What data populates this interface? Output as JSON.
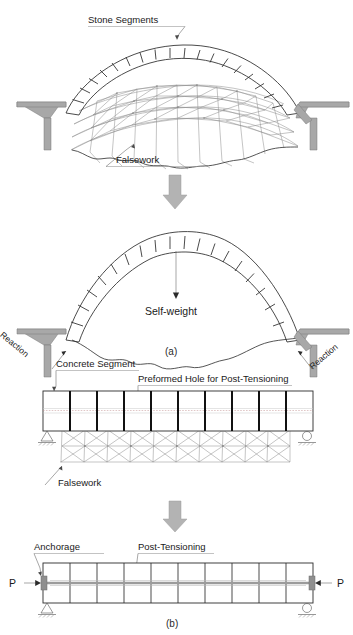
{
  "figure": {
    "title_parts": [
      "(a)",
      "(b)"
    ],
    "panel_a": {
      "caption": "(a)",
      "stage1": {
        "labels": {
          "stone_segments": "Stone Segments",
          "falsework": "Falsework"
        },
        "segment_count": 15,
        "description": "Masonry arch of stone voussoirs built on a falsework truss centering supported between two abutments."
      },
      "transition_arrow": "down-block-arrow",
      "stage2": {
        "labels": {
          "self_weight": "Self-weight",
          "reaction_left": "Reaction",
          "reaction_right": "Reaction"
        },
        "segment_count": 15,
        "description": "Completed stone arch carrying self-weight; falsework removed, abutment reactions shown."
      }
    },
    "panel_b": {
      "caption": "(b)",
      "stage1": {
        "labels": {
          "concrete_segment": "Concrete Segment",
          "preformed_hole": "Preformed Hole for Post-Tensioning",
          "falsework": "Falsework"
        },
        "segment_count": 10,
        "supports": [
          "pin",
          "roller"
        ],
        "description": "Precast concrete segments placed on falsework truss, each with a preformed duct for post-tensioning."
      },
      "transition_arrow": "down-block-arrow",
      "stage2": {
        "labels": {
          "anchorage": "Anchorage",
          "post_tensioning": "Post-Tensioning",
          "force_left": "P",
          "force_right": "P"
        },
        "segment_count": 10,
        "supports": [
          "pin",
          "roller"
        ],
        "description": "Segmental beam post-tensioned with force P applied at anchorages at each end."
      }
    }
  },
  "colors": {
    "line": "#2b2b2b",
    "falsework": "#8a8a8a",
    "abutment": "#a8a8a8",
    "block_arrow": "#b3b3b3",
    "tendon": "#9b9b9b",
    "hole": "#c08f8f",
    "text": "#1a1a1a",
    "background": "#ffffff"
  }
}
